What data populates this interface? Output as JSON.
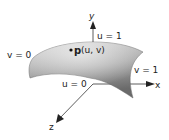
{
  "diagram": {
    "type": "parametric-surface-patch",
    "axes": {
      "x_label": "x",
      "y_label": "y",
      "z_label": "z"
    },
    "edge_labels": {
      "v0": "v = 0",
      "v1": "v = 1",
      "u0": "u = 0",
      "u1": "u = 1"
    },
    "point": {
      "symbol": "p",
      "args": "(u, v)"
    },
    "colors": {
      "surface_light": "#d6d6d6",
      "surface_dark": "#6e6e6e",
      "axis": "#333333"
    }
  }
}
